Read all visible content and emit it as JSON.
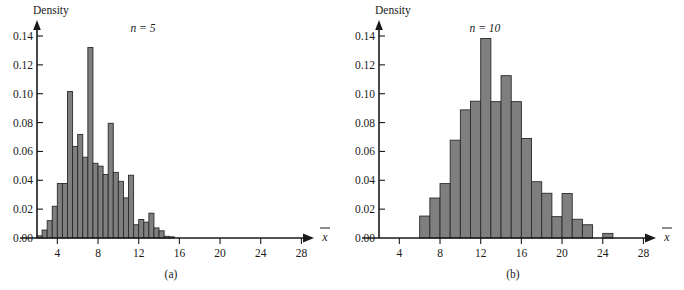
{
  "figure": {
    "background_color": "#ffffff",
    "bar_fill_color": "#7f7f7f",
    "bar_stroke_color": "#2a2a2a",
    "axis_color": "#1a1a1a"
  },
  "chart_data": [
    {
      "type": "bar",
      "panel_id": "a",
      "caption": "(a)",
      "annotation": "n = 5",
      "annotation_symbol": "n",
      "annotation_value": "5",
      "title": "",
      "ylabel": "Density",
      "xlabel": "x̄",
      "xlabel_base": "x",
      "grid": false,
      "legend": "none",
      "xlim": [
        1.0,
        29.8
      ],
      "ylim": [
        0.0,
        0.148
      ],
      "bin_width": 0.5,
      "xticks": [
        4,
        8,
        12,
        16,
        20,
        24,
        28
      ],
      "xtick_labels": [
        "4",
        "8",
        "12",
        "16",
        "20",
        "24",
        "28"
      ],
      "yticks": [
        0.0,
        0.02,
        0.04,
        0.06,
        0.08,
        0.1,
        0.12,
        0.14
      ],
      "ytick_labels": [
        "0.00",
        "0.02",
        "0.04",
        "0.06",
        "0.08",
        "0.10",
        "0.12",
        "0.14"
      ],
      "bins": [
        {
          "x0": 2.0,
          "x1": 2.5,
          "value": 0.0015
        },
        {
          "x0": 2.5,
          "x1": 3.0,
          "value": 0.0055
        },
        {
          "x0": 3.0,
          "x1": 3.5,
          "value": 0.012
        },
        {
          "x0": 3.5,
          "x1": 4.0,
          "value": 0.022
        },
        {
          "x0": 4.0,
          "x1": 4.5,
          "value": 0.0378
        },
        {
          "x0": 4.5,
          "x1": 5.0,
          "value": 0.0378
        },
        {
          "x0": 5.0,
          "x1": 5.5,
          "value": 0.1015
        },
        {
          "x0": 5.5,
          "x1": 6.0,
          "value": 0.0635
        },
        {
          "x0": 6.0,
          "x1": 6.5,
          "value": 0.0718
        },
        {
          "x0": 6.5,
          "x1": 7.0,
          "value": 0.056
        },
        {
          "x0": 7.0,
          "x1": 7.5,
          "value": 0.132
        },
        {
          "x0": 7.5,
          "x1": 8.0,
          "value": 0.0518
        },
        {
          "x0": 8.0,
          "x1": 8.5,
          "value": 0.0498
        },
        {
          "x0": 8.5,
          "x1": 9.0,
          "value": 0.044
        },
        {
          "x0": 9.0,
          "x1": 9.5,
          "value": 0.0795
        },
        {
          "x0": 9.5,
          "x1": 10.0,
          "value": 0.0455
        },
        {
          "x0": 10.0,
          "x1": 10.5,
          "value": 0.0393
        },
        {
          "x0": 10.5,
          "x1": 11.0,
          "value": 0.0278
        },
        {
          "x0": 11.0,
          "x1": 11.5,
          "value": 0.0435
        },
        {
          "x0": 11.5,
          "x1": 12.0,
          "value": 0.0092
        },
        {
          "x0": 12.0,
          "x1": 12.5,
          "value": 0.0128
        },
        {
          "x0": 12.5,
          "x1": 13.0,
          "value": 0.011
        },
        {
          "x0": 13.0,
          "x1": 13.5,
          "value": 0.0172
        },
        {
          "x0": 13.5,
          "x1": 14.0,
          "value": 0.007
        },
        {
          "x0": 14.0,
          "x1": 14.5,
          "value": 0.005
        },
        {
          "x0": 14.5,
          "x1": 15.0,
          "value": 0.0012
        },
        {
          "x0": 15.0,
          "x1": 15.5,
          "value": 0.0008
        }
      ],
      "bins_x_offset_note": "bins listed with synthetic index; actual x centers derived in template",
      "values": [
        0.0015,
        0.0055,
        0.012,
        0.022,
        0.0378,
        0.0378,
        0.1015,
        0.0635,
        0.0718,
        0.056,
        0.132,
        0.0518,
        0.0498,
        0.044,
        0.0795,
        0.0455,
        0.0393,
        0.0278,
        0.0435,
        0.0092,
        0.0128,
        0.011,
        0.0172,
        0.007,
        0.005,
        0.0012,
        0.0008
      ],
      "categories": [
        "2.0-3.0",
        "3.0-4.0",
        "4.0-5.0",
        "5.0-6.0",
        "6.0-7.0",
        "7.0-8.0",
        "8.0-9.0",
        "9.0-10.0",
        "10.0-11.0",
        "11.0-12.0",
        "12.0-13.0",
        "13.0-14.0",
        "14.0-15.0",
        "15.0-16.0",
        "16.0-17.0",
        "17.0-18.0",
        "18.0-19.0",
        "19.0-20.0",
        "20.0-21.0",
        "21.0-22.0",
        "22.0-23.0",
        "23.0-24.0",
        "24.0-25.0",
        "25.0-26.0",
        "26.0-27.0",
        "27.0-28.0",
        "28.0-29.0"
      ],
      "data_start_x": 2.0
    },
    {
      "type": "bar",
      "panel_id": "b",
      "caption": "(b)",
      "annotation": "n = 10",
      "annotation_symbol": "n",
      "annotation_value": "10",
      "title": "",
      "ylabel": "Density",
      "xlabel": "x̄",
      "xlabel_base": "x",
      "grid": false,
      "legend": "none",
      "xlim": [
        1.0,
        29.8
      ],
      "ylim": [
        0.0,
        0.148
      ],
      "bin_width": 1.0,
      "xticks": [
        4,
        8,
        12,
        16,
        20,
        24,
        28
      ],
      "xtick_labels": [
        "4",
        "8",
        "12",
        "16",
        "20",
        "24",
        "28"
      ],
      "yticks": [
        0.0,
        0.02,
        0.04,
        0.06,
        0.08,
        0.1,
        0.12,
        0.14
      ],
      "ytick_labels": [
        "0.00",
        "0.02",
        "0.04",
        "0.06",
        "0.08",
        "0.10",
        "0.12",
        "0.14"
      ],
      "bins": [
        {
          "x0": 6.0,
          "x1": 7.0,
          "value": 0.0152
        },
        {
          "x0": 7.0,
          "x1": 8.0,
          "value": 0.0277
        },
        {
          "x0": 8.0,
          "x1": 9.0,
          "value": 0.0377
        },
        {
          "x0": 9.0,
          "x1": 10.0,
          "value": 0.0678
        },
        {
          "x0": 10.0,
          "x1": 11.0,
          "value": 0.0888
        },
        {
          "x0": 11.0,
          "x1": 12.0,
          "value": 0.0948
        },
        {
          "x0": 12.0,
          "x1": 13.0,
          "value": 0.1383
        },
        {
          "x0": 13.0,
          "x1": 14.0,
          "value": 0.0945
        },
        {
          "x0": 14.0,
          "x1": 15.0,
          "value": 0.1125
        },
        {
          "x0": 15.0,
          "x1": 16.0,
          "value": 0.0945
        },
        {
          "x0": 16.0,
          "x1": 17.0,
          "value": 0.069
        },
        {
          "x0": 17.0,
          "x1": 18.0,
          "value": 0.039
        },
        {
          "x0": 18.0,
          "x1": 19.0,
          "value": 0.031
        },
        {
          "x0": 19.0,
          "x1": 20.0,
          "value": 0.0148
        },
        {
          "x0": 20.0,
          "x1": 21.0,
          "value": 0.0308
        },
        {
          "x0": 21.0,
          "x1": 22.0,
          "value": 0.013
        },
        {
          "x0": 22.0,
          "x1": 23.0,
          "value": 0.0092
        },
        {
          "x0": 23.0,
          "x1": 24.0,
          "value": 0.0
        },
        {
          "x0": 24.0,
          "x1": 25.0,
          "value": 0.0032
        }
      ],
      "values": [
        0.0152,
        0.0277,
        0.0377,
        0.0678,
        0.0888,
        0.0948,
        0.1383,
        0.0945,
        0.1125,
        0.0945,
        0.069,
        0.039,
        0.031,
        0.0148,
        0.0308,
        0.013,
        0.0092,
        0.0,
        0.0032
      ],
      "categories": [
        "6-7",
        "7-8",
        "8-9",
        "9-10",
        "10-11",
        "11-12",
        "12-13",
        "13-14",
        "14-15",
        "15-16",
        "16-17",
        "17-18",
        "18-19",
        "19-20",
        "20-21",
        "21-22",
        "22-23",
        "23-24",
        "24-25"
      ],
      "data_start_x": 6.0
    }
  ]
}
